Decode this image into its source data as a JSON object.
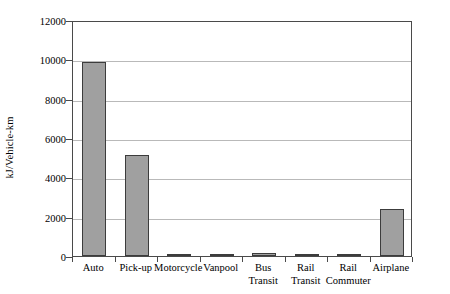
{
  "chart_data": {
    "type": "bar",
    "title": "",
    "xlabel": "",
    "ylabel": "kJ/Vehicle-km",
    "ylim": [
      0,
      12000
    ],
    "ytick_values": [
      0,
      2000,
      4000,
      6000,
      8000,
      10000,
      12000
    ],
    "ytick_labels": [
      "0",
      "2000",
      "4000",
      "6000",
      "8000",
      "10000",
      "12000"
    ],
    "grid": true,
    "legend": false,
    "categories": [
      "Auto",
      "Pick-up",
      "Motorcycle",
      "Vanpool",
      "Bus Transit",
      "Rail Transit",
      "Rail Commuter",
      "Airplane"
    ],
    "category_lines": [
      {
        "line1": "Auto",
        "line2": ""
      },
      {
        "line1": "Pick-up",
        "line2": ""
      },
      {
        "line1": "Motorcycle",
        "line2": ""
      },
      {
        "line1": "Vanpool",
        "line2": ""
      },
      {
        "line1": "Bus",
        "line2": "Transit"
      },
      {
        "line1": "Rail",
        "line2": "Transit"
      },
      {
        "line1": "Rail",
        "line2": "Commuter"
      },
      {
        "line1": "Airplane",
        "line2": ""
      }
    ],
    "values": [
      9850,
      5150,
      60,
      40,
      150,
      90,
      70,
      2400
    ],
    "bar_color": "#a0a0a0",
    "bar_border_color": "#3c3c3c",
    "gridline_color": "#b9b9b9",
    "axis_color": "#4a4a4a"
  }
}
